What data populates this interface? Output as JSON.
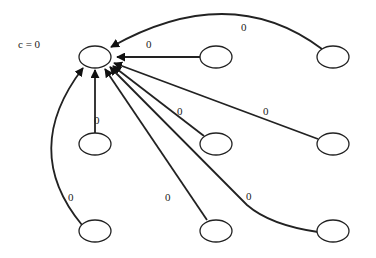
{
  "diagram": {
    "title_label": "c = 0",
    "target_node": {
      "id": "center",
      "cx": 95,
      "cy": 57
    },
    "nodes": [
      {
        "id": "top-middle",
        "cx": 216,
        "cy": 57
      },
      {
        "id": "top-right",
        "cx": 333,
        "cy": 57
      },
      {
        "id": "mid-left",
        "cx": 95,
        "cy": 144
      },
      {
        "id": "mid-middle",
        "cx": 216,
        "cy": 144
      },
      {
        "id": "mid-right",
        "cx": 333,
        "cy": 144
      },
      {
        "id": "bottom-left",
        "cx": 95,
        "cy": 231
      },
      {
        "id": "bottom-middle",
        "cx": 216,
        "cy": 231
      },
      {
        "id": "bottom-right",
        "cx": 333,
        "cy": 231
      }
    ],
    "edges": [
      {
        "from": "top-middle",
        "to": "center",
        "label": "0"
      },
      {
        "from": "top-right",
        "to": "center",
        "label": "0"
      },
      {
        "from": "mid-left",
        "to": "center",
        "label": "0"
      },
      {
        "from": "mid-middle",
        "to": "center",
        "label": "0"
      },
      {
        "from": "mid-right",
        "to": "center",
        "label": "0"
      },
      {
        "from": "bottom-left",
        "to": "center",
        "label": "0"
      },
      {
        "from": "bottom-middle",
        "to": "center",
        "label": "0"
      },
      {
        "from": "bottom-right",
        "to": "center",
        "label": "0"
      }
    ]
  }
}
